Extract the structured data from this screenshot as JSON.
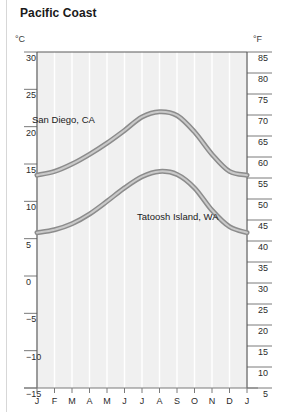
{
  "title": "Pacific Coast",
  "axes": {
    "left_unit": "°C",
    "right_unit": "°F"
  },
  "chart_data": {
    "type": "line",
    "title": "Pacific Coast",
    "xlabel": "",
    "ylabel": "°C",
    "y2label": "°F",
    "ylim": [
      -15,
      30
    ],
    "y2lim": [
      5,
      85
    ],
    "yticks": [
      30,
      25,
      20,
      15,
      10,
      5,
      0,
      -5,
      -10,
      -15
    ],
    "y2ticks": [
      85,
      80,
      75,
      70,
      65,
      60,
      55,
      50,
      45,
      40,
      35,
      30,
      25,
      20,
      15,
      10,
      5
    ],
    "categories": [
      "J",
      "F",
      "M",
      "A",
      "M",
      "J",
      "J",
      "A",
      "S",
      "O",
      "N",
      "D",
      "J"
    ],
    "grid": "vertical",
    "legend": "inline-annotation",
    "series": [
      {
        "name": "San Diego, CA",
        "color": "#8c8c8c",
        "values": [
          13.5,
          14.0,
          15.0,
          16.3,
          17.8,
          19.5,
          21.3,
          22.0,
          21.5,
          19.3,
          16.3,
          14.0,
          13.5
        ],
        "label_x": "M",
        "label_y": 20.5
      },
      {
        "name": "Tatoosh Island, WA",
        "color": "#8c8c8c",
        "values": [
          5.8,
          6.2,
          7.0,
          8.3,
          10.0,
          11.8,
          13.3,
          14.0,
          13.6,
          11.8,
          8.8,
          6.6,
          5.8
        ],
        "label_x": "S",
        "label_y": 7.5
      }
    ]
  }
}
